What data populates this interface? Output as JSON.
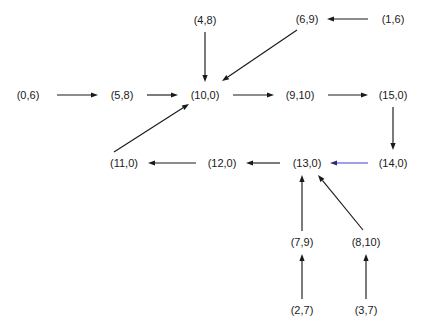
{
  "diagram": {
    "type": "directed-graph",
    "title": "",
    "background_color": "#ffffff",
    "default_edge_color": "#1a1a1a",
    "accent_edge_color": "#5a5ad0",
    "nodes": [
      {
        "id": "n0",
        "label": "(0,6)",
        "x": 28,
        "y": 95
      },
      {
        "id": "n1",
        "label": "(5,8)",
        "x": 122,
        "y": 95
      },
      {
        "id": "n2",
        "label": "(10,0)",
        "x": 205,
        "y": 95
      },
      {
        "id": "n3",
        "label": "(9,10)",
        "x": 300,
        "y": 95
      },
      {
        "id": "n4",
        "label": "(15,0)",
        "x": 393,
        "y": 95
      },
      {
        "id": "n5",
        "label": "(4,8)",
        "x": 205,
        "y": 20
      },
      {
        "id": "n6",
        "label": "(6,9)",
        "x": 307,
        "y": 19
      },
      {
        "id": "n7",
        "label": "(1,6)",
        "x": 393,
        "y": 19
      },
      {
        "id": "n8",
        "label": "(11,0)",
        "x": 124,
        "y": 163
      },
      {
        "id": "n9",
        "label": "(12,0)",
        "x": 222,
        "y": 163
      },
      {
        "id": "n10",
        "label": "(13,0)",
        "x": 307,
        "y": 163
      },
      {
        "id": "n11",
        "label": "(14,0)",
        "x": 393,
        "y": 163
      },
      {
        "id": "n12",
        "label": "(7,9)",
        "x": 302,
        "y": 242
      },
      {
        "id": "n13",
        "label": "(8,10)",
        "x": 366,
        "y": 242
      },
      {
        "id": "n14",
        "label": "(2,7)",
        "x": 302,
        "y": 310
      },
      {
        "id": "n15",
        "label": "(3,7)",
        "x": 366,
        "y": 310
      }
    ],
    "edges": [
      {
        "from": "(0,6)",
        "to": "(5,8)",
        "color": "#1a1a1a",
        "x1": 57,
        "y1": 95,
        "x2": 98,
        "y2": 95
      },
      {
        "from": "(5,8)",
        "to": "(10,0)",
        "color": "#1a1a1a",
        "x1": 147,
        "y1": 95,
        "x2": 178,
        "y2": 95
      },
      {
        "from": "(4,8)",
        "to": "(10,0)",
        "color": "#1a1a1a",
        "x1": 205,
        "y1": 32,
        "x2": 205,
        "y2": 82
      },
      {
        "from": "(6,9)",
        "to": "(10,0)",
        "color": "#1a1a1a",
        "x1": 297,
        "y1": 30,
        "x2": 222,
        "y2": 81
      },
      {
        "from": "(1,6)",
        "to": "(6,9)",
        "color": "#1a1a1a",
        "x1": 368,
        "y1": 19,
        "x2": 327,
        "y2": 19
      },
      {
        "from": "(10,0)",
        "to": "(9,10)",
        "color": "#1a1a1a",
        "x1": 233,
        "y1": 95,
        "x2": 274,
        "y2": 95
      },
      {
        "from": "(9,10)",
        "to": "(15,0)",
        "color": "#1a1a1a",
        "x1": 328,
        "y1": 95,
        "x2": 368,
        "y2": 95
      },
      {
        "from": "(15,0)",
        "to": "(14,0)",
        "color": "#1a1a1a",
        "x1": 393,
        "y1": 107,
        "x2": 393,
        "y2": 150
      },
      {
        "from": "(14,0)",
        "to": "(13,0)",
        "color": "#5a5ad0",
        "x1": 368,
        "y1": 163,
        "x2": 330,
        "y2": 163
      },
      {
        "from": "(13,0)",
        "to": "(12,0)",
        "color": "#1a1a1a",
        "x1": 280,
        "y1": 163,
        "x2": 246,
        "y2": 163
      },
      {
        "from": "(12,0)",
        "to": "(11,0)",
        "color": "#1a1a1a",
        "x1": 196,
        "y1": 163,
        "x2": 148,
        "y2": 163
      },
      {
        "from": "(11,0)",
        "to": "(10,0)",
        "color": "#1a1a1a",
        "x1": 114,
        "y1": 152,
        "x2": 189,
        "y2": 104
      },
      {
        "from": "(7,9)",
        "to": "(13,0)",
        "color": "#1a1a1a",
        "x1": 302,
        "y1": 231,
        "x2": 302,
        "y2": 175
      },
      {
        "from": "(8,10)",
        "to": "(13,0)",
        "color": "#1a1a1a",
        "x1": 363,
        "y1": 230,
        "x2": 318,
        "y2": 175
      },
      {
        "from": "(2,7)",
        "to": "(7,9)",
        "color": "#1a1a1a",
        "x1": 302,
        "y1": 299,
        "x2": 302,
        "y2": 254
      },
      {
        "from": "(3,7)",
        "to": "(8,10)",
        "color": "#1a1a1a",
        "x1": 366,
        "y1": 299,
        "x2": 366,
        "y2": 254
      }
    ]
  }
}
